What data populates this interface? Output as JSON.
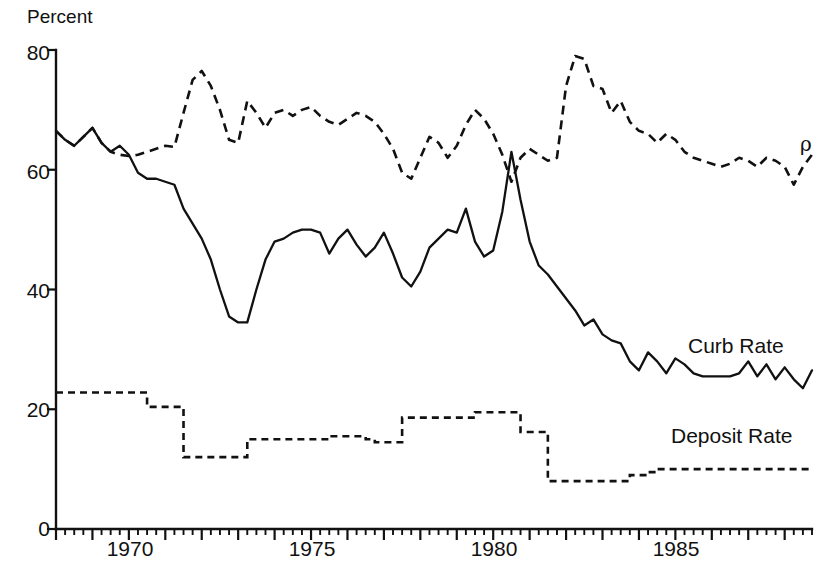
{
  "figure": {
    "axis_label_y": "Percent",
    "rho_symbol": "ρ",
    "bottom_caption": ""
  },
  "labels": {
    "curb_rate": "Curb Rate",
    "deposit_rate": "Deposit Rate"
  },
  "axes": {
    "y_ticks": [
      "0",
      "20",
      "40",
      "60",
      "80"
    ],
    "x_ticks": [
      "1970",
      "1975",
      "1980",
      "1985"
    ]
  },
  "chart_data": {
    "type": "line",
    "title": "",
    "subtitle": "",
    "xlabel": "",
    "ylabel": "Percent",
    "ylim": [
      0,
      80
    ],
    "xlim": [
      1968.0,
      1988.75
    ],
    "grid": false,
    "legend_position": "inline-right",
    "x_tick_labels": [
      "1970",
      "1975",
      "1980",
      "1985"
    ],
    "x_tick_values": [
      1970,
      1975,
      1980,
      1985
    ],
    "y_tick_values": [
      0,
      20,
      40,
      60,
      80
    ],
    "x_minor_tick_interval": 0.25,
    "annotations": [
      {
        "text": "Curb Rate",
        "x": 1985.6,
        "y": 32.5
      },
      {
        "text": "Deposit Rate",
        "x": 1985.3,
        "y": 15.5
      },
      {
        "text": "ρ",
        "x": 1988.9,
        "y": 63.0
      }
    ],
    "x": [
      1968.0,
      1968.25,
      1968.5,
      1968.75,
      1969.0,
      1969.25,
      1969.5,
      1969.75,
      1970.0,
      1970.25,
      1970.5,
      1970.75,
      1971.0,
      1971.25,
      1971.5,
      1971.75,
      1972.0,
      1972.25,
      1972.5,
      1972.75,
      1973.0,
      1973.25,
      1973.5,
      1973.75,
      1974.0,
      1974.25,
      1974.5,
      1974.75,
      1975.0,
      1975.25,
      1975.5,
      1975.75,
      1976.0,
      1976.25,
      1976.5,
      1976.75,
      1977.0,
      1977.25,
      1977.5,
      1977.75,
      1978.0,
      1978.25,
      1978.5,
      1978.75,
      1979.0,
      1979.25,
      1979.5,
      1979.75,
      1980.0,
      1980.25,
      1980.5,
      1980.75,
      1981.0,
      1981.25,
      1981.5,
      1981.75,
      1982.0,
      1982.25,
      1982.5,
      1982.75,
      1983.0,
      1983.25,
      1983.5,
      1983.75,
      1984.0,
      1984.25,
      1984.5,
      1984.75,
      1985.0,
      1985.25,
      1985.5,
      1985.75,
      1986.0,
      1986.25,
      1986.5,
      1986.75,
      1987.0,
      1987.25,
      1987.5,
      1987.75,
      1988.0,
      1988.25,
      1988.5,
      1988.75
    ],
    "series": [
      {
        "name": "rho",
        "label": "ρ",
        "style": "dashed",
        "values": [
          66.5,
          65.0,
          64.0,
          65.5,
          67.0,
          64.5,
          63.0,
          62.5,
          62.3,
          62.5,
          63.0,
          63.5,
          64.0,
          63.8,
          69.5,
          75.0,
          76.5,
          74.0,
          70.0,
          65.0,
          64.5,
          71.5,
          69.5,
          67.0,
          69.5,
          70.0,
          69.0,
          70.0,
          70.5,
          69.0,
          68.0,
          67.5,
          68.5,
          69.5,
          69.0,
          68.0,
          66.0,
          63.5,
          59.5,
          58.5,
          62.0,
          65.5,
          64.5,
          62.0,
          64.0,
          67.5,
          70.0,
          68.5,
          66.0,
          62.5,
          58.0,
          62.0,
          63.5,
          62.5,
          61.5,
          62.0,
          74.0,
          79.0,
          78.5,
          74.0,
          73.5,
          69.5,
          71.5,
          68.0,
          66.5,
          66.0,
          64.5,
          66.0,
          65.0,
          63.0,
          62.0,
          61.5,
          61.0,
          60.5,
          61.0,
          62.0,
          61.5,
          60.5,
          62.0,
          61.5,
          60.5,
          57.5,
          60.5,
          62.5
        ]
      },
      {
        "name": "curb_rate",
        "label": "Curb Rate",
        "style": "solid",
        "values": [
          66.5,
          65.0,
          64.0,
          65.5,
          67.0,
          64.5,
          63.0,
          64.0,
          62.5,
          59.5,
          58.5,
          58.5,
          58.0,
          57.5,
          53.5,
          51.0,
          48.5,
          45.0,
          40.0,
          35.5,
          34.5,
          34.5,
          40.0,
          45.0,
          48.0,
          48.5,
          49.5,
          50.0,
          50.0,
          49.5,
          46.0,
          48.5,
          50.0,
          47.5,
          45.5,
          47.0,
          49.5,
          46.0,
          42.0,
          40.5,
          43.0,
          47.0,
          48.5,
          50.0,
          49.5,
          53.5,
          48.0,
          45.5,
          46.5,
          53.0,
          63.0,
          55.0,
          48.0,
          44.0,
          42.5,
          40.5,
          38.5,
          36.5,
          34.0,
          35.0,
          32.5,
          31.5,
          31.0,
          28.0,
          26.5,
          29.5,
          28.0,
          26.0,
          28.5,
          27.5,
          26.0,
          25.5,
          25.5,
          25.5,
          25.5,
          26.0,
          28.0,
          25.5,
          27.5,
          25.0,
          27.0,
          25.0,
          23.5,
          26.5
        ]
      },
      {
        "name": "deposit_rate",
        "label": "Deposit Rate",
        "style": "dotted",
        "values": [
          22.8,
          22.8,
          22.8,
          22.8,
          22.8,
          22.8,
          22.8,
          22.8,
          22.8,
          22.8,
          20.4,
          20.4,
          20.4,
          20.4,
          12.0,
          12.0,
          12.0,
          12.0,
          12.0,
          12.0,
          12.0,
          15.0,
          15.0,
          15.0,
          15.0,
          15.0,
          15.0,
          15.0,
          15.0,
          15.0,
          15.5,
          15.5,
          15.5,
          15.5,
          15.0,
          14.5,
          14.5,
          14.5,
          18.6,
          18.6,
          18.6,
          18.6,
          18.6,
          18.6,
          18.6,
          18.6,
          19.5,
          19.5,
          19.5,
          19.5,
          19.5,
          16.2,
          16.2,
          16.2,
          8.0,
          8.0,
          8.0,
          8.0,
          8.0,
          8.0,
          8.0,
          8.0,
          8.0,
          9.0,
          9.0,
          9.5,
          10.0,
          10.0,
          10.0,
          10.0,
          10.0,
          10.0,
          10.0,
          10.0,
          10.0,
          10.0,
          10.0,
          10.0,
          10.0,
          10.0,
          10.0,
          10.0,
          10.0,
          10.0
        ]
      }
    ]
  }
}
